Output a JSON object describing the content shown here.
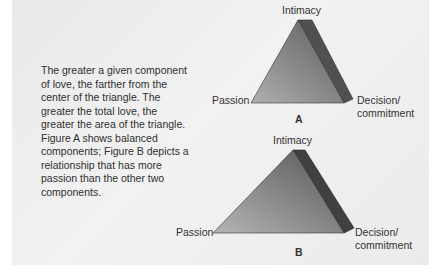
{
  "caption": "The greater a given component of love, the farther from the center of the triangle. The greater the total love, the greater the area of the triangle. Figure A shows balanced components; Figure B depicts a relationship that has more passion than the other two components.",
  "figures": [
    {
      "id": "A",
      "label": "A",
      "vertices": {
        "top": "Intimacy",
        "left": "Passion",
        "right_line1": "Decision/",
        "right_line2": "commitment"
      }
    },
    {
      "id": "B",
      "label": "B",
      "vertices": {
        "top": "Intimacy",
        "left": "Passion",
        "right_line1": "Decision/",
        "right_line2": "commitment"
      }
    }
  ],
  "colors": {
    "triangle_dark": "#5a5a5a",
    "triangle_light": "#a8a8a8",
    "side_face": "#4a4a4a",
    "panel_bg": "#eeeeee",
    "text": "#333333"
  }
}
